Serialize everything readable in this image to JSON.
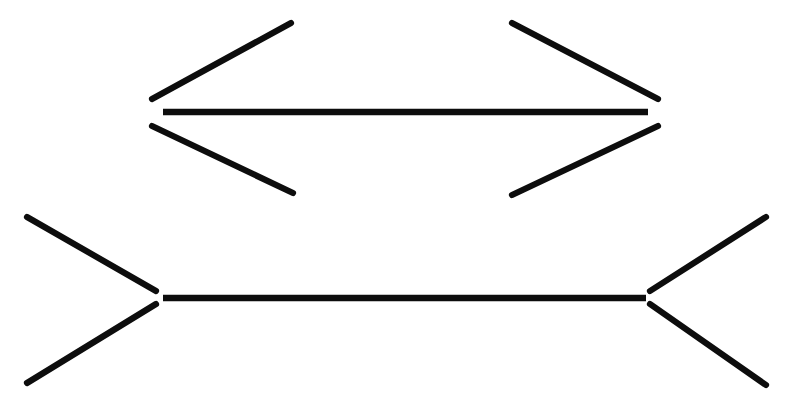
{
  "figure": {
    "name": "Muller-Lyer illusion",
    "background_color": "#ffffff",
    "stroke_color": "#0d0d0d",
    "canvas": {
      "width": 787,
      "height": 403
    },
    "description": "Two horizontal line segments of similar length; the upper one is bounded by inward-pointing arrowheads and the lower one by outward-pointing arrowheads.",
    "shapes": [
      {
        "id": "top-figure",
        "label": "Upper figure with inward-pointing arrowheads",
        "shaft": {
          "x1": 163,
          "y1": 112,
          "x2": 648,
          "y2": 112,
          "length_px": 485
        },
        "fins": [
          {
            "id": "top-left-upper-fin",
            "x1": 152,
            "y1": 99,
            "x2": 291,
            "y2": 23
          },
          {
            "id": "top-left-lower-fin",
            "x1": 152,
            "y1": 126,
            "x2": 293,
            "y2": 193
          },
          {
            "id": "top-right-upper-fin",
            "x1": 658,
            "y1": 99,
            "x2": 512,
            "y2": 23
          },
          {
            "id": "top-right-lower-fin",
            "x1": 658,
            "y1": 126,
            "x2": 512,
            "y2": 195
          }
        ]
      },
      {
        "id": "bottom-figure",
        "label": "Lower figure with outward-pointing arrowheads",
        "shaft": {
          "x1": 163,
          "y1": 298,
          "x2": 646,
          "y2": 298,
          "length_px": 483
        },
        "fins": [
          {
            "id": "bottom-left-upper-fin",
            "x1": 156,
            "y1": 291,
            "x2": 27,
            "y2": 217
          },
          {
            "id": "bottom-left-lower-fin",
            "x1": 156,
            "y1": 304,
            "x2": 27,
            "y2": 383
          },
          {
            "id": "bottom-right-upper-fin",
            "x1": 650,
            "y1": 291,
            "x2": 766,
            "y2": 217
          },
          {
            "id": "bottom-right-lower-fin",
            "x1": 650,
            "y1": 304,
            "x2": 766,
            "y2": 385
          }
        ]
      }
    ]
  }
}
